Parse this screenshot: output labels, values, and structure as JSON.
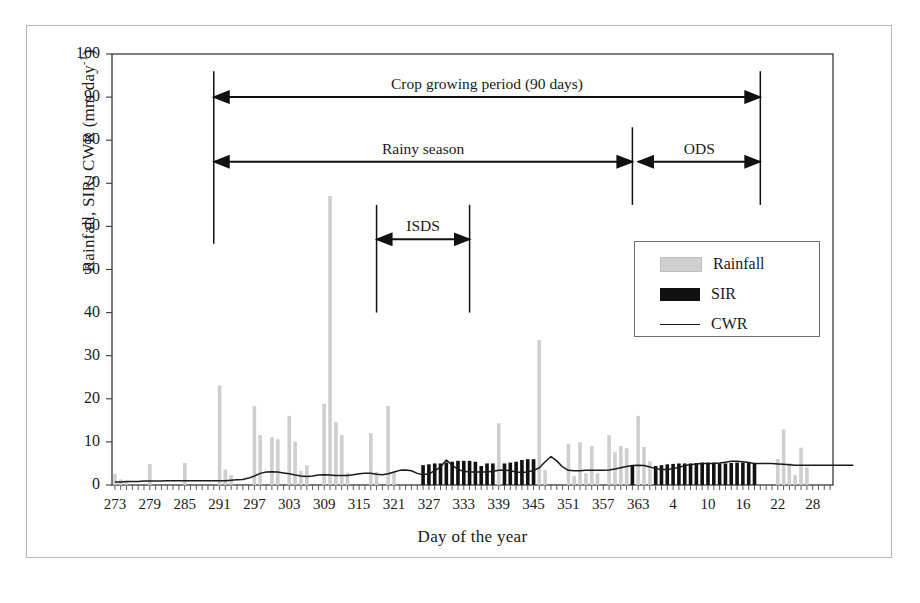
{
  "chart_data": {
    "type": "bar",
    "title": "",
    "xlabel": "Day of the year",
    "ylabel": "Rainfall, SIR, CWR  (mm day-1)",
    "ylabel_main": "Rainfall, SIR, CWR  (mm day",
    "ylabel_exponent": "-1",
    "ylabel_close": ")",
    "ylim": [
      0,
      100
    ],
    "ytick_labels": [
      "0",
      "10",
      "20",
      "30",
      "40",
      "50",
      "60",
      "70",
      "80",
      "90",
      "100"
    ],
    "ytick_values": [
      0,
      10,
      20,
      30,
      40,
      50,
      60,
      70,
      80,
      90,
      100
    ],
    "xtick_labels": [
      "273",
      "279",
      "285",
      "291",
      "297",
      "303",
      "309",
      "315",
      "321",
      "327",
      "333",
      "339",
      "345",
      "351",
      "357",
      "363",
      "4",
      "10",
      "16",
      "22",
      "28"
    ],
    "xtick_indices": [
      0,
      6,
      12,
      18,
      24,
      30,
      36,
      42,
      48,
      54,
      60,
      66,
      72,
      78,
      84,
      90,
      96,
      102,
      108,
      114,
      120
    ],
    "x_index_count": 124,
    "grid": false,
    "legend_position": "inside-right-upper",
    "legend": [
      {
        "label": "Rainfall",
        "marker": "filled-bar",
        "color": "#cfcfcf"
      },
      {
        "label": "SIR",
        "marker": "filled-bar",
        "color": "#111111"
      },
      {
        "label": "CWR",
        "marker": "line",
        "color": "#1a1a1a"
      }
    ],
    "series": [
      {
        "name": "Rainfall",
        "type": "bar",
        "color": "#cfcfcf",
        "values": [
          2.5,
          1.2,
          0.6,
          0,
          0,
          0,
          4.8,
          0,
          0,
          0,
          0,
          0,
          5.0,
          0,
          0,
          0,
          0,
          0,
          23.0,
          3.5,
          2.2,
          0,
          0,
          0,
          18.2,
          11.5,
          0,
          11.0,
          10.5,
          0,
          16.0,
          10.0,
          3.2,
          4.5,
          0,
          0,
          18.8,
          67.0,
          14.5,
          11.5,
          2.8,
          0,
          0,
          0,
          12.0,
          3.0,
          0,
          18.3,
          3.0,
          0,
          0,
          0,
          0,
          0,
          0,
          0,
          0,
          0,
          0,
          0,
          0,
          0,
          0,
          0,
          0,
          0,
          14.2,
          0,
          3.2,
          0,
          0,
          0,
          5.4,
          33.5,
          3.4,
          0,
          0,
          0,
          9.5,
          2.0,
          9.8,
          2.6,
          9.0,
          2.6,
          0,
          11.5,
          7.5,
          9.0,
          8.4,
          0,
          16.0,
          8.8,
          5.4,
          3.2,
          0,
          0,
          0,
          0,
          0,
          0,
          0,
          0,
          0,
          0,
          0,
          0,
          0,
          0,
          0,
          0,
          0,
          0,
          0,
          0,
          6.0,
          12.8,
          5.0,
          2.2,
          8.6,
          4.0,
          0,
          0,
          0,
          0,
          0,
          0,
          0,
          0
        ]
      },
      {
        "name": "SIR",
        "type": "bar",
        "color": "#111111",
        "values": [
          0,
          0,
          0,
          0,
          0,
          0,
          0,
          0,
          0,
          0,
          0,
          0,
          0,
          0,
          0,
          0,
          0,
          0,
          0,
          0,
          0,
          0,
          0,
          0,
          0,
          0,
          0,
          0,
          0,
          0,
          0,
          0,
          0,
          0,
          0,
          0,
          0,
          0,
          0,
          0,
          0,
          0,
          0,
          0,
          0,
          0,
          0,
          0,
          0,
          0,
          0,
          0,
          0,
          4.6,
          4.8,
          5.0,
          5.0,
          5.2,
          5.4,
          5.6,
          5.6,
          5.6,
          5.4,
          4.4,
          5.0,
          5.0,
          0,
          5.0,
          5.2,
          5.4,
          5.8,
          6.0,
          6.0,
          0,
          0,
          0,
          0,
          0,
          0,
          0,
          0,
          0,
          0,
          0,
          0,
          0,
          0,
          0,
          0,
          4.6,
          0,
          0,
          0,
          4.4,
          4.6,
          4.8,
          4.9,
          5.0,
          5.0,
          5.0,
          5.1,
          5.2,
          5.2,
          5.2,
          5.0,
          5.0,
          5.1,
          5.2,
          5.2,
          5.2,
          5.0,
          0,
          0,
          0,
          0,
          0,
          0,
          0,
          0,
          0,
          0,
          0,
          0,
          0,
          0,
          0,
          0,
          0
        ]
      },
      {
        "name": "CWR",
        "type": "line",
        "color": "#1a1a1a",
        "values": [
          0.7,
          0.7,
          0.8,
          0.8,
          0.8,
          0.9,
          0.9,
          0.9,
          0.9,
          1.0,
          1.0,
          1.0,
          1.0,
          1.0,
          1.0,
          1.0,
          1.0,
          1.0,
          1.0,
          1.0,
          1.1,
          1.2,
          1.3,
          1.6,
          2.1,
          2.7,
          3.0,
          3.1,
          3.0,
          2.8,
          2.6,
          2.3,
          2.1,
          2.0,
          2.1,
          2.3,
          2.4,
          2.3,
          2.2,
          2.2,
          2.2,
          2.4,
          2.6,
          2.7,
          2.7,
          2.5,
          2.4,
          2.6,
          3.0,
          3.4,
          3.5,
          3.3,
          2.7,
          2.4,
          2.6,
          3.3,
          4.2,
          5.8,
          4.6,
          3.6,
          3.2,
          3.0,
          3.0,
          3.0,
          3.0,
          3.2,
          3.4,
          3.5,
          3.3,
          3.0,
          2.9,
          3.0,
          3.4,
          4.0,
          5.4,
          6.6,
          5.6,
          4.2,
          3.4,
          3.3,
          3.3,
          3.4,
          3.4,
          3.4,
          3.4,
          3.5,
          3.7,
          4.0,
          4.3,
          4.5,
          4.6,
          4.5,
          4.2,
          3.8,
          3.6,
          3.6,
          3.8,
          4.1,
          4.5,
          4.7,
          4.9,
          5.0,
          5.0,
          5.0,
          5.1,
          5.3,
          5.5,
          5.5,
          5.4,
          5.2,
          5.0,
          5.0,
          5.0,
          5.0,
          4.9,
          4.8,
          4.7,
          4.6,
          4.6,
          4.6,
          4.6,
          4.6,
          4.6,
          4.6,
          4.6,
          4.6,
          4.6,
          4.6
        ]
      }
    ],
    "annotations": [
      {
        "id": "crop-growing-period",
        "label": "Crop growing period (90 days)",
        "start_index": 17,
        "end_index": 111,
        "y_value": 90
      },
      {
        "id": "rainy-season",
        "label": "Rainy season",
        "start_index": 17,
        "end_index": 89,
        "y_value": 75
      },
      {
        "id": "ods",
        "label": "ODS",
        "start_index": 90,
        "end_index": 111,
        "y_value": 75
      },
      {
        "id": "isds",
        "label": "ISDS",
        "start_index": 45,
        "end_index": 61,
        "y_value": 57
      }
    ]
  }
}
